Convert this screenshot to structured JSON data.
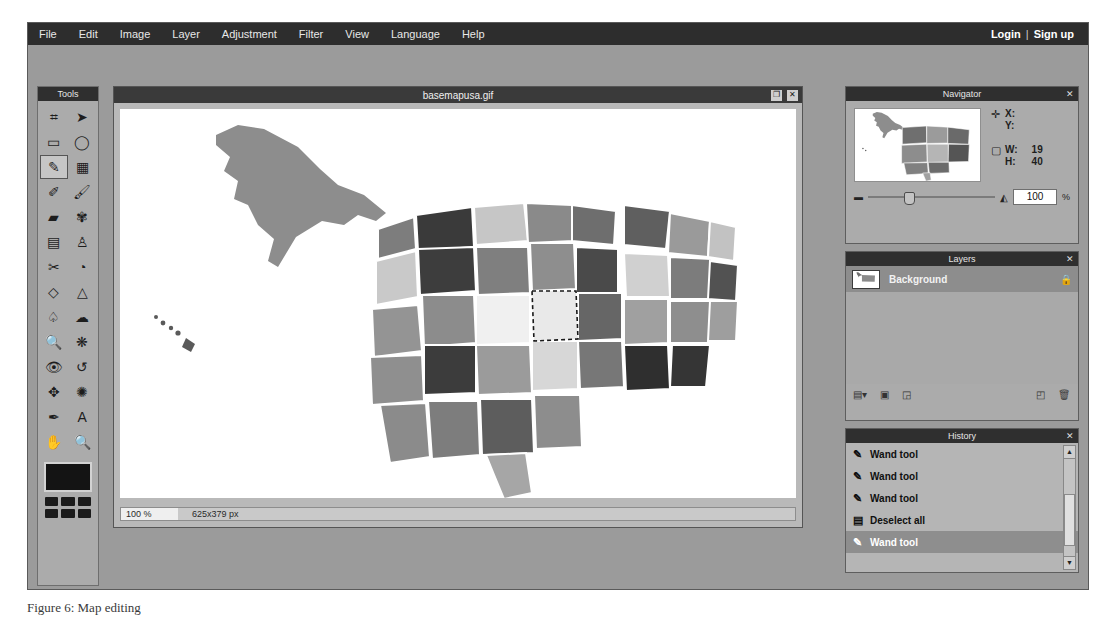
{
  "menu": {
    "items": [
      "File",
      "Edit",
      "Image",
      "Layer",
      "Adjustment",
      "Filter",
      "View",
      "Language",
      "Help"
    ],
    "login": "Login",
    "separator": "|",
    "signup": "Sign up"
  },
  "tools": {
    "title": "Tools",
    "items": [
      {
        "name": "crop-tool",
        "glyph": "⌗"
      },
      {
        "name": "move-tool",
        "glyph": "➤"
      },
      {
        "name": "rectangle-select-tool",
        "glyph": "▭"
      },
      {
        "name": "lasso-tool",
        "glyph": "◯"
      },
      {
        "name": "magic-wand-tool",
        "glyph": "✎",
        "selected": true
      },
      {
        "name": "crop-selection-tool",
        "glyph": "▦"
      },
      {
        "name": "pencil-tool",
        "glyph": "✐"
      },
      {
        "name": "brush-tool",
        "glyph": "🖌"
      },
      {
        "name": "eraser-tool",
        "glyph": "▰"
      },
      {
        "name": "clone-stamp-tool",
        "glyph": "✾"
      },
      {
        "name": "gradient-tool",
        "glyph": "▤"
      },
      {
        "name": "paint-bucket-tool",
        "glyph": "♙"
      },
      {
        "name": "smudge-tool",
        "glyph": "✂"
      },
      {
        "name": "blur-tool",
        "glyph": "◔"
      },
      {
        "name": "dodge-tool",
        "glyph": "◇"
      },
      {
        "name": "burn-tool",
        "glyph": "△"
      },
      {
        "name": "sponge-tool",
        "glyph": "♤"
      },
      {
        "name": "cloud-tool",
        "glyph": "☁"
      },
      {
        "name": "zoom-select-tool",
        "glyph": "🔍"
      },
      {
        "name": "sharpen-tool",
        "glyph": "❋"
      },
      {
        "name": "red-eye-tool",
        "glyph": "👁"
      },
      {
        "name": "undo-tool",
        "glyph": "↺"
      },
      {
        "name": "transform-tool",
        "glyph": "✥"
      },
      {
        "name": "spider-tool",
        "glyph": "✺"
      },
      {
        "name": "eyedropper-tool",
        "glyph": "✒"
      },
      {
        "name": "text-tool",
        "glyph": "A"
      },
      {
        "name": "hand-tool",
        "glyph": "✋"
      },
      {
        "name": "zoom-tool",
        "glyph": "🔍"
      }
    ],
    "foreground_color": "#141414",
    "palette": [
      "#1b1b1b",
      "#1b1b1b",
      "#1b1b1b",
      "#1b1b1b",
      "#1b1b1b",
      "#1b1b1b"
    ]
  },
  "document": {
    "title": "basemapusa.gif",
    "maximize_glyph": "❐",
    "close_glyph": "✕",
    "status_zoom": "100 %",
    "status_size": "625x379 px"
  },
  "navigator": {
    "title": "Navigator",
    "close_glyph": "✕",
    "position_icon": "✛",
    "x_label": "X:",
    "y_label": "Y:",
    "x_value": "",
    "y_value": "",
    "size_icon": "▢",
    "w_label": "W:",
    "h_label": "H:",
    "w_value": "19",
    "h_value": "40",
    "zoom_out_glyph": "▬",
    "zoom_in_glyph": "◭",
    "zoom_value": "100",
    "percent": "%"
  },
  "layers": {
    "title": "Layers",
    "close_glyph": "✕",
    "rows": [
      {
        "name": "Background",
        "locked": true,
        "lock_glyph": "🔒",
        "selected": true
      }
    ],
    "tools": [
      {
        "name": "layer-styles-button",
        "glyph": "▤▾"
      },
      {
        "name": "layer-mask-button",
        "glyph": "▣"
      },
      {
        "name": "layer-group-button",
        "glyph": "◲"
      },
      {
        "name": "new-layer-button",
        "glyph": "◰"
      },
      {
        "name": "delete-layer-button",
        "glyph": "🗑"
      }
    ]
  },
  "history": {
    "title": "History",
    "close_glyph": "✕",
    "rows": [
      {
        "label": "Wand tool",
        "icon": "✎",
        "selected": false
      },
      {
        "label": "Wand tool",
        "icon": "✎",
        "selected": false
      },
      {
        "label": "Wand tool",
        "icon": "✎",
        "selected": false
      },
      {
        "label": "Deselect all",
        "icon": "▤",
        "selected": false
      },
      {
        "label": "Wand tool",
        "icon": "✎",
        "selected": true
      }
    ],
    "scroll_up_glyph": "▲",
    "scroll_down_glyph": "▼"
  },
  "caption": "Figure 6: Map editing"
}
